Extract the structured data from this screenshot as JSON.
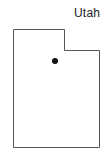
{
  "map": {
    "label": "Utah",
    "outline_color": "#555555",
    "outline_width": 1,
    "fill_color": "#ffffff",
    "outline_points": [
      [
        13,
        29
      ],
      [
        64,
        29
      ],
      [
        64,
        50
      ],
      [
        99,
        50
      ],
      [
        99,
        147
      ],
      [
        13,
        147
      ]
    ],
    "marker": {
      "x": 55,
      "y": 61,
      "radius": 3,
      "color": "#111111"
    }
  }
}
